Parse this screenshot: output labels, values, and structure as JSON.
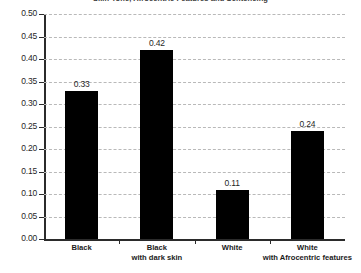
{
  "chart_data": {
    "type": "bar",
    "title": "Skin Tone, Afrocentric Features and Sentencing",
    "subtitle": "",
    "xlabel": "",
    "ylabel": "",
    "categories": [
      "Black",
      "Black with dark skin",
      "White",
      "White with Afrocentric features"
    ],
    "category_lines": [
      [
        "Black",
        ""
      ],
      [
        "Black",
        "with dark skin"
      ],
      [
        "White",
        ""
      ],
      [
        "White",
        "with Afrocentric features"
      ]
    ],
    "values": [
      0.33,
      0.42,
      0.11,
      0.24
    ],
    "value_labels": [
      "0.33",
      "0.42",
      "0.11",
      "0.24"
    ],
    "ylim": [
      0.0,
      0.5
    ],
    "ytick_step": 0.05,
    "ytick_labels": [
      "0.50",
      "0.45",
      "0.40",
      "0.35",
      "0.30",
      "0.25",
      "0.20",
      "0.15",
      "0.10",
      "0.05",
      "0.00"
    ],
    "ytick_values": [
      0.5,
      0.45,
      0.4,
      0.35,
      0.3,
      0.25,
      0.2,
      0.15,
      0.1,
      0.05,
      0.0
    ],
    "grid": true,
    "grid_style": "dashed",
    "legend": false,
    "legend_position": "none",
    "colors": {
      "bar": "#000000",
      "grid": "#b9b9b9",
      "axis": "#2b2b2b",
      "text": "#1f1f1f",
      "background": "#ffffff"
    }
  }
}
